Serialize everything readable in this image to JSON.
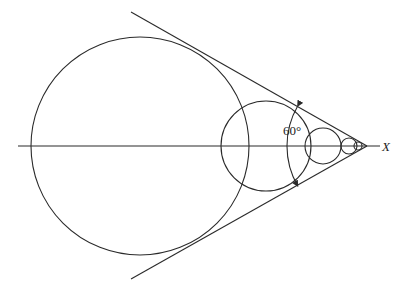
{
  "diagram": {
    "title": "",
    "axis": {
      "x1": 18,
      "x2": 380,
      "y": 146,
      "label": "X",
      "label_x": 382,
      "label_y": 151
    },
    "vertex": {
      "x": 367,
      "y": 146
    },
    "tangent_lines": [
      {
        "name": "upper",
        "x1": 131,
        "y1": 12,
        "x2": 367,
        "y2": 146
      },
      {
        "name": "lower",
        "x1": 131,
        "y1": 279,
        "x2": 367,
        "y2": 146
      }
    ],
    "circles": [
      {
        "cx": 140,
        "cy": 146,
        "r": 109
      },
      {
        "cx": 266,
        "cy": 146,
        "r": 45
      },
      {
        "cx": 323,
        "cy": 146,
        "r": 18
      },
      {
        "cx": 349,
        "cy": 146,
        "r": 8
      },
      {
        "cx": 358,
        "cy": 146,
        "r": 4
      }
    ],
    "angle": {
      "label": "60°",
      "value_deg": 60,
      "arc_radius": 80,
      "label_x": 283,
      "label_y": 135
    },
    "colors": {
      "stroke": "#2a2a2a",
      "background": "#ffffff"
    }
  }
}
